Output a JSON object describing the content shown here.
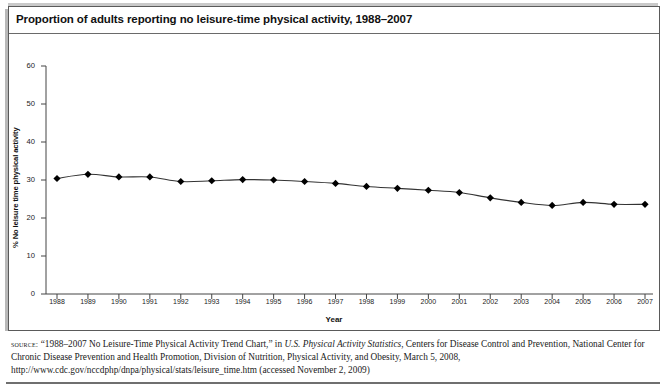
{
  "figure": {
    "title": "Proportion of adults reporting no leisure-time physical activity, 1988–2007"
  },
  "chart_data": {
    "type": "line",
    "title": "Proportion of adults reporting no leisure-time physical activity, 1988–2007",
    "xlabel": "Year",
    "ylabel": "% No leisure time physical activity",
    "categories": [
      "1988",
      "1989",
      "1990",
      "1991",
      "1992",
      "1993",
      "1994",
      "1995",
      "1996",
      "1997",
      "1998",
      "1999",
      "2000",
      "2001",
      "2002",
      "2003",
      "2004",
      "2005",
      "2006",
      "2007"
    ],
    "values": [
      30.4,
      31.5,
      30.8,
      30.8,
      29.6,
      29.8,
      30.1,
      30.0,
      29.6,
      29.1,
      28.3,
      27.8,
      27.3,
      26.7,
      25.3,
      24.1,
      23.3,
      24.1,
      23.6,
      23.6
    ],
    "series": [
      {
        "name": "% No leisure time physical activity",
        "values": [
          30.4,
          31.5,
          30.8,
          30.8,
          29.6,
          29.8,
          30.1,
          30.0,
          29.6,
          29.1,
          28.3,
          27.8,
          27.3,
          26.7,
          25.3,
          24.1,
          23.3,
          24.1,
          23.6,
          23.6
        ]
      }
    ],
    "ylim": [
      0,
      60
    ],
    "yticks": [
      0,
      10,
      20,
      30,
      40,
      50,
      60
    ],
    "ytick_labels": [
      "0",
      "10",
      "20",
      "30",
      "40",
      "50",
      "60"
    ],
    "xtick_labels": [
      "1988",
      "1989",
      "1990",
      "1991",
      "1992",
      "1993",
      "1994",
      "1995",
      "1996",
      "1997",
      "1998",
      "1999",
      "2000",
      "2001",
      "2002",
      "2003",
      "2004",
      "2005",
      "2006",
      "2007"
    ],
    "grid": false,
    "legend": false,
    "marker": "diamond",
    "line_color": "#333333",
    "marker_color": "#000000"
  },
  "source": {
    "kicker": "source:",
    "text_part_1": " “1988–2007 No Leisure-Time Physical Activity Trend Chart,” in ",
    "italic_part": "U.S. Physical Activity Statistics",
    "text_part_2": ", Centers for Disease Control and Prevention, National Center for Chronic Disease Prevention and Health Promotion, Division of Nutrition, Physical Activity, and Obesity, March 5, 2008, http://www.cdc.gov/nccdphp/dnpa/physical/stats/leisure_time.htm (accessed November 2, 2009)"
  }
}
